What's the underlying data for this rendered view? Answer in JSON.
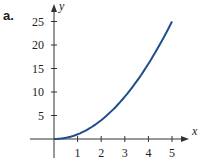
{
  "panel_label": "a.",
  "chart_data": {
    "type": "line",
    "title": "",
    "xlabel": "x",
    "ylabel": "y",
    "function": "y = x^2",
    "x": [
      0,
      0.5,
      1,
      1.5,
      2,
      2.5,
      3,
      3.5,
      4,
      4.5,
      5
    ],
    "series": [
      {
        "name": "y = x^2",
        "values": [
          0,
          0.25,
          1,
          2.25,
          4,
          6.25,
          9,
          12.25,
          16,
          20.25,
          25
        ]
      }
    ],
    "x_ticks": [
      "1",
      "2",
      "3",
      "4",
      "5"
    ],
    "y_ticks": [
      "5",
      "10",
      "15",
      "20",
      "25"
    ],
    "xlim": [
      0,
      5.5
    ],
    "ylim": [
      0,
      27
    ],
    "grid": false,
    "legend": "none",
    "colors": {
      "curve": "#1f4e8c",
      "axis": "#333333"
    }
  }
}
